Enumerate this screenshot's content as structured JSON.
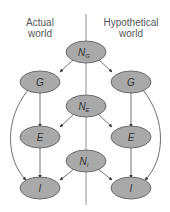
{
  "diagram": {
    "left_label_line1": "Actual",
    "left_label_line2": "world",
    "right_label_line1": "Hypothetical",
    "right_label_line2": "world",
    "nodes": {
      "NG": {
        "main": "N",
        "sub": "G"
      },
      "G_left": {
        "main": "G"
      },
      "G_right": {
        "main": "G"
      },
      "NE": {
        "main": "N",
        "sub": "E"
      },
      "E_left": {
        "main": "E"
      },
      "E_right": {
        "main": "E"
      },
      "NI": {
        "main": "N",
        "sub": "I"
      },
      "I_left": {
        "main": "I"
      },
      "I_right": {
        "main": "I"
      }
    },
    "node_color": "#a9a9a9"
  }
}
